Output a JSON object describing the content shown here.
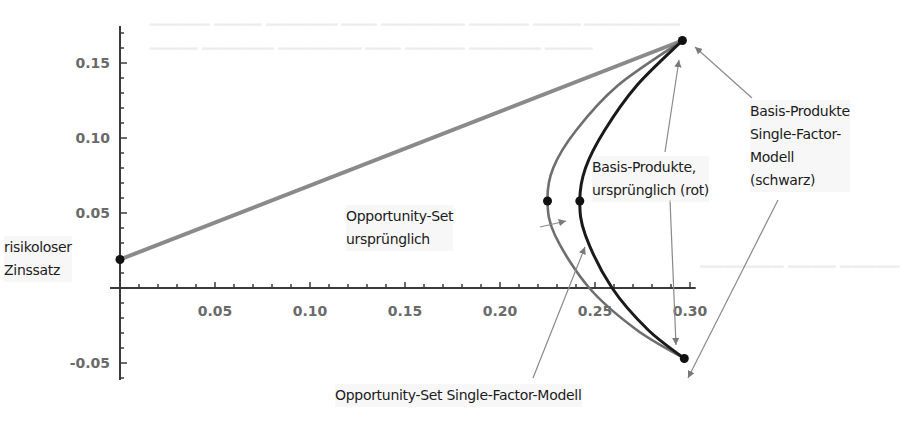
{
  "chart_data": {
    "type": "line",
    "title": "",
    "xlabel": "",
    "ylabel": "",
    "xlim": [
      0,
      0.3
    ],
    "ylim": [
      -0.055,
      0.175
    ],
    "grid": false,
    "legend": null,
    "x_ticks": [
      "0.05",
      "0.10",
      "0.15",
      "0.20",
      "0.25",
      "0.30"
    ],
    "x_tick_values": [
      0.05,
      0.1,
      0.15,
      0.2,
      0.25,
      0.3
    ],
    "y_ticks": [
      "0.15",
      "0.10",
      "0.05",
      "-0.05"
    ],
    "y_tick_values": [
      0.15,
      0.1,
      0.05,
      -0.05
    ],
    "series": [
      {
        "name": "Kapitalmarktlinie (risikoloser Zinssatz zu Basis-Produkt)",
        "kind": "line",
        "color": "#8a8a8a",
        "x": [
          0.0,
          0.296
        ],
        "y": [
          0.019,
          0.165
        ]
      },
      {
        "name": "Opportunity-Set ursprünglich",
        "kind": "curve",
        "color": "#6e6e6e",
        "x": [
          0.296,
          0.262,
          0.24,
          0.228,
          0.225,
          0.229,
          0.247,
          0.272,
          0.297
        ],
        "y": [
          0.165,
          0.135,
          0.105,
          0.08,
          0.058,
          0.035,
          0.0,
          -0.028,
          -0.047
        ]
      },
      {
        "name": "Opportunity-Set Single-Factor-Modell",
        "kind": "curve",
        "color": "#1a1a1a",
        "x": [
          0.296,
          0.272,
          0.255,
          0.245,
          0.242,
          0.245,
          0.259,
          0.278,
          0.297
        ],
        "y": [
          0.165,
          0.135,
          0.105,
          0.08,
          0.058,
          0.035,
          0.0,
          -0.028,
          -0.047
        ]
      }
    ],
    "points": [
      {
        "label": "risikoloser Zinssatz",
        "x": 0.0,
        "y": 0.019
      },
      {
        "label": "Basis-Produkt oben",
        "x": 0.296,
        "y": 0.165
      },
      {
        "label": "Basis-Produkt unten",
        "x": 0.297,
        "y": -0.047
      },
      {
        "label": "Tangentialpunkt ursprünglich",
        "x": 0.225,
        "y": 0.058
      },
      {
        "label": "Tangentialpunkt Single-Factor",
        "x": 0.242,
        "y": 0.058
      }
    ],
    "annotations": [
      {
        "id": "riskfree",
        "text": "risikoloser\nZinssatz"
      },
      {
        "id": "opp_orig",
        "text": "Opportunity-Set\nursprünglich"
      },
      {
        "id": "basis_rot",
        "text": "Basis-Produkte,\nursprünglich (rot)"
      },
      {
        "id": "basis_schwarz",
        "text": "Basis-Produkte\nSingle-Factor-\nModell\n(schwarz)"
      },
      {
        "id": "opp_sfm",
        "text": "Opportunity-Set Single-Factor-Modell"
      }
    ]
  }
}
